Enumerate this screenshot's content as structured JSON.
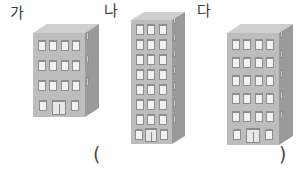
{
  "scene": {
    "background_color": "#ffffff",
    "facade_color": "#bdbdbd",
    "side_wall_color": "#9a9a9a",
    "roof_color": "#cfcfcf",
    "window_color": "#f2f2f2",
    "window_border_color": "#8e8e8e",
    "label_color": "#3b3b3b"
  },
  "labels": [
    {
      "text": "가",
      "x": 10,
      "y": 6
    },
    {
      "text": "나",
      "x": 104,
      "y": 4
    },
    {
      "text": "다",
      "x": 197,
      "y": 4
    }
  ],
  "parentheses": [
    {
      "text": "(",
      "x": 93,
      "y": 145
    },
    {
      "text": ")",
      "x": 279,
      "y": 145
    }
  ],
  "buildings": [
    {
      "name": "가",
      "id": "building-ga",
      "x": 33,
      "y": 24,
      "facade_width": 52,
      "facade_height": 84,
      "side_width": 14,
      "roof_rise": 9,
      "floors": 4,
      "windows_per_floor": 4,
      "ground_floor": {
        "windows": 2,
        "has_door": true
      },
      "window_width": 8,
      "window_height": 11,
      "door_width": 14,
      "door_height": 15
    },
    {
      "name": "나",
      "id": "building-na",
      "x": 131,
      "y": 12,
      "facade_width": 41,
      "facade_height": 124,
      "side_width": 13,
      "roof_rise": 8,
      "floors": 8,
      "windows_per_floor": 3,
      "ground_floor": {
        "windows": 2,
        "has_door": true
      },
      "window_width": 8,
      "window_height": 11,
      "door_width": 12,
      "door_height": 14
    },
    {
      "name": "다",
      "id": "building-da",
      "x": 227,
      "y": 24,
      "facade_width": 52,
      "facade_height": 112,
      "side_width": 14,
      "roof_rise": 9,
      "floors": 6,
      "windows_per_floor": 4,
      "ground_floor": {
        "windows": 2,
        "has_door": true
      },
      "window_width": 8,
      "window_height": 11,
      "door_width": 14,
      "door_height": 15
    }
  ]
}
